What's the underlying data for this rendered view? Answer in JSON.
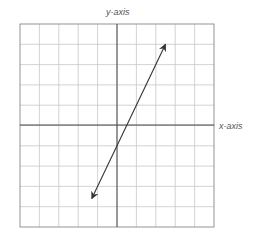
{
  "chart_data": {
    "type": "line",
    "title": "",
    "xlabel": "x-axis",
    "ylabel": "y-axis",
    "grid": true,
    "grid_cells": 10,
    "xlim": [
      -5,
      5
    ],
    "ylim": [
      -5,
      5
    ],
    "tick_labels": false,
    "series": [
      {
        "name": "line",
        "equation": "y = 2x - 1",
        "arrows_both_ends": true,
        "x": [
          -1.3,
          2.5
        ],
        "y": [
          -3.6,
          4.0
        ]
      }
    ]
  },
  "labels": {
    "x_axis": "x-axis",
    "y_axis": "y-axis"
  },
  "colors": {
    "grid": "#c8c8c8",
    "axis": "#444444",
    "line": "#333333",
    "border": "#888888"
  }
}
